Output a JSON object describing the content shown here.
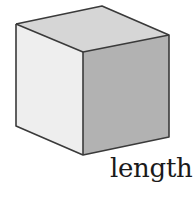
{
  "diagram": {
    "label": "length",
    "faces": {
      "top": {
        "name": "top-face",
        "color": "#d6d6d6"
      },
      "left": {
        "name": "left-face",
        "color": "#eeeeee"
      },
      "right": {
        "name": "right-face",
        "color": "#b2b2b2"
      }
    },
    "edge_color": "#3a3a3a"
  }
}
